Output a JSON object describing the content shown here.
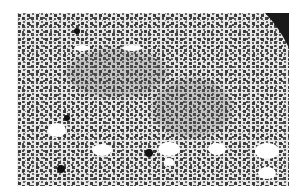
{
  "image": {
    "kind": "grayscale light micrograph",
    "description": "Densely packed dark cell nuclei in pale tissue with scattered round white vacuoles and a black background corner at top right",
    "frame": {
      "x": 17,
      "y": 13,
      "width": 272,
      "height": 173
    },
    "colors": {
      "background": "#ffffff",
      "tissue": "#e6e6e6",
      "nucleus": "#3a3a3a",
      "dense_region": "#555555",
      "corner": "#1a1a1a",
      "vacuole": "#ffffff"
    },
    "vacuoles": [
      {
        "cx": 40,
        "cy": 117,
        "rx": 9,
        "ry": 7
      },
      {
        "cx": 85,
        "cy": 137,
        "rx": 10,
        "ry": 6
      },
      {
        "cx": 152,
        "cy": 136,
        "rx": 11,
        "ry": 7
      },
      {
        "cx": 200,
        "cy": 136,
        "rx": 9,
        "ry": 6
      },
      {
        "cx": 152,
        "cy": 149,
        "rx": 5,
        "ry": 4
      },
      {
        "cx": 250,
        "cy": 138,
        "rx": 12,
        "ry": 8
      },
      {
        "cx": 250,
        "cy": 160,
        "rx": 9,
        "ry": 6
      },
      {
        "cx": 115,
        "cy": 35,
        "rx": 10,
        "ry": 3
      },
      {
        "cx": 65,
        "cy": 35,
        "rx": 8,
        "ry": 3
      }
    ],
    "dark_features": [
      {
        "cx": 44,
        "cy": 156,
        "r": 4
      },
      {
        "cx": 132,
        "cy": 140,
        "r": 4
      },
      {
        "cx": 50,
        "cy": 105,
        "r": 3
      },
      {
        "cx": 60,
        "cy": 18,
        "r": 3
      }
    ],
    "dense_regions": [
      {
        "cx": 175,
        "cy": 95,
        "rx": 40,
        "ry": 30
      },
      {
        "cx": 100,
        "cy": 60,
        "rx": 50,
        "ry": 25
      }
    ]
  }
}
